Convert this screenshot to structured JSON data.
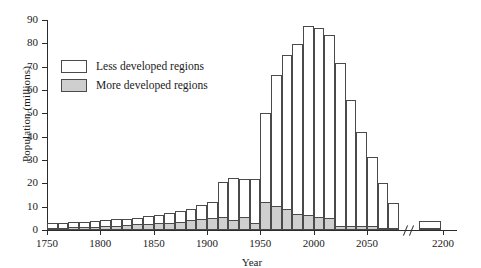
{
  "chart_data": {
    "type": "bar",
    "title": "",
    "xlabel": "Year",
    "ylabel": "Population (millions)",
    "stacked": true,
    "grid": false,
    "legend_position": "upper-left",
    "ylim": [
      0,
      90
    ],
    "yticks": [
      0,
      10,
      20,
      30,
      40,
      50,
      60,
      70,
      80,
      90
    ],
    "xlim": [
      1750,
      2090
    ],
    "xticks": [
      1750,
      1800,
      1850,
      1900,
      1950,
      2000,
      2050,
      2200
    ],
    "axis_break": {
      "after": 2080,
      "label": "//"
    },
    "bin_width_years": 10,
    "categories": [
      1750,
      1760,
      1770,
      1780,
      1790,
      1800,
      1810,
      1820,
      1830,
      1840,
      1850,
      1860,
      1870,
      1880,
      1890,
      1900,
      1910,
      1920,
      1930,
      1940,
      1950,
      1960,
      1970,
      1980,
      1990,
      2000,
      2010,
      2020,
      2030,
      2040,
      2050,
      2060,
      2070,
      2200
    ],
    "series": [
      {
        "name": "More developed regions",
        "color": "#cfcfcf",
        "values": [
          1.0,
          1.0,
          1.2,
          1.3,
          1.5,
          1.7,
          1.9,
          2.1,
          2.4,
          2.7,
          3.0,
          3.2,
          3.5,
          4.2,
          4.8,
          5.2,
          5.5,
          4.1,
          5.6,
          3.2,
          11.8,
          10.4,
          8.8,
          6.7,
          6.4,
          5.6,
          5.0,
          1.9,
          1.8,
          1.8,
          1.7,
          0.6,
          0.5,
          0.2
        ]
      },
      {
        "name": "Less developed regions",
        "color": "#ffffff",
        "values": [
          1.9,
          2.0,
          2.1,
          2.2,
          2.3,
          2.5,
          2.7,
          2.8,
          2.9,
          3.2,
          3.6,
          4.0,
          4.5,
          5.0,
          5.8,
          6.8,
          15.2,
          18.4,
          16.2,
          18.7,
          38.2,
          56.0,
          66.1,
          73.2,
          81.1,
          80.9,
          78.4,
          69.8,
          53.9,
          40.1,
          29.5,
          19.4,
          11.2,
          3.7
        ]
      }
    ],
    "totals": [
      2.9,
      3.0,
      3.3,
      3.5,
      3.8,
      4.2,
      4.6,
      4.9,
      5.3,
      5.9,
      6.6,
      7.2,
      8.0,
      9.2,
      10.6,
      12.0,
      20.7,
      22.5,
      21.8,
      21.9,
      50.0,
      66.4,
      74.9,
      79.9,
      87.5,
      86.5,
      83.4,
      71.7,
      55.7,
      41.9,
      31.2,
      20.0,
      11.7,
      3.9
    ]
  },
  "legend": {
    "items": [
      {
        "label": "Less developed regions",
        "swatch": "white"
      },
      {
        "label": "More developed regions",
        "swatch": "gray"
      }
    ]
  },
  "axes": {
    "y_title": "Population (millions)",
    "x_title": "Year",
    "y_tick_labels": [
      "0",
      "10",
      "20",
      "30",
      "40",
      "50",
      "60",
      "70",
      "80",
      "90"
    ],
    "x_tick_labels": [
      "1750",
      "1800",
      "1850",
      "1900",
      "1950",
      "2000",
      "2050",
      "2200"
    ]
  }
}
